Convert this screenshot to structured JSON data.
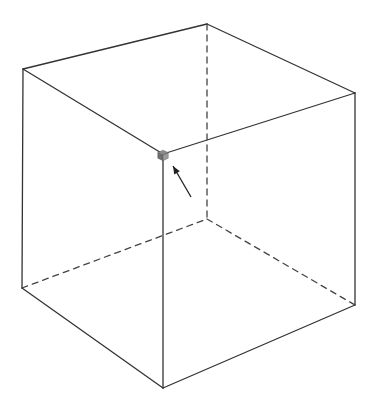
{
  "diagram": {
    "type": "wireframe-cube",
    "colors": {
      "edge": "#333333",
      "hidden_edge": "#444444",
      "marker_top": "#8a8a8a",
      "marker_left": "#6e6e6e",
      "marker_right": "#9c9c9c",
      "background": "#ffffff"
    },
    "vertices": {
      "top_left": [
        23,
        69
      ],
      "top_back": [
        207,
        24
      ],
      "top_right": [
        355,
        93
      ],
      "top_front": [
        163,
        154
      ],
      "bottom_left": [
        22,
        288
      ],
      "bottom_back": [
        207,
        219
      ],
      "bottom_right": [
        355,
        305
      ],
      "bottom_front": [
        163,
        388
      ]
    },
    "visible_edges": [
      [
        "top_left",
        "top_back"
      ],
      [
        "top_back",
        "top_right"
      ],
      [
        "top_left",
        "top_front"
      ],
      [
        "top_front",
        "top_right"
      ],
      [
        "top_left",
        "bottom_left"
      ],
      [
        "top_right",
        "bottom_right"
      ],
      [
        "top_front",
        "bottom_front"
      ],
      [
        "bottom_left",
        "bottom_front"
      ],
      [
        "bottom_front",
        "bottom_right"
      ]
    ],
    "hidden_edges": [
      [
        "top_back",
        "bottom_back"
      ],
      [
        "bottom_left",
        "bottom_back"
      ],
      [
        "bottom_back",
        "bottom_right"
      ]
    ],
    "marker": {
      "at": "top_front",
      "size": 7
    },
    "arrow": {
      "from": [
        191,
        197
      ],
      "to": [
        173,
        166
      ]
    }
  }
}
